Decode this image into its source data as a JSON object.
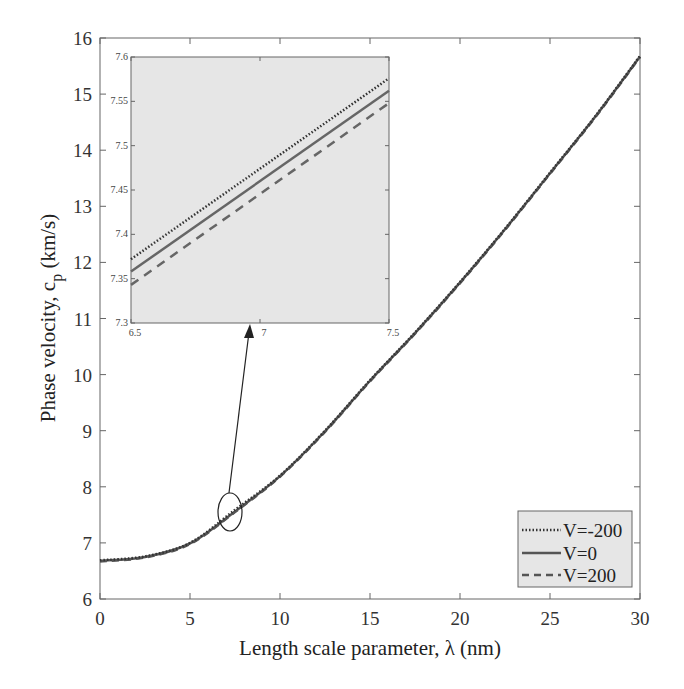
{
  "chart_data": [
    {
      "type": "line",
      "title": "",
      "xlabel": "Length scale parameter, λ (nm)",
      "ylabel": "Phase velocity, c_p (km/s)",
      "ylabel_main": "Phase velocity, c",
      "ylabel_sub": "p",
      "ylabel_unit": " (km/s)",
      "xlim": [
        0,
        30
      ],
      "ylim": [
        6,
        16
      ],
      "xticks": [
        0,
        5,
        10,
        15,
        20,
        25,
        30
      ],
      "yticks": [
        6,
        7,
        8,
        9,
        10,
        11,
        12,
        13,
        14,
        15,
        16
      ],
      "grid": false,
      "legend_position": "lower right",
      "x": [
        0,
        2.5,
        5,
        7.5,
        10,
        12.5,
        15,
        17.5,
        20,
        22.5,
        25,
        27.5,
        30
      ],
      "series": [
        {
          "name": "V=-200",
          "style": "dotted",
          "values": [
            6.69,
            6.76,
            7.0,
            7.59,
            8.2,
            9.0,
            9.9,
            10.75,
            11.65,
            12.6,
            13.6,
            14.6,
            15.68
          ]
        },
        {
          "name": "V=0",
          "style": "solid",
          "values": [
            6.68,
            6.75,
            6.99,
            7.56,
            8.19,
            8.99,
            9.89,
            10.74,
            11.64,
            12.59,
            13.59,
            14.59,
            15.67
          ]
        },
        {
          "name": "V=200",
          "style": "dashed",
          "values": [
            6.67,
            6.74,
            6.98,
            7.55,
            8.18,
            8.98,
            9.88,
            10.73,
            11.63,
            12.58,
            13.58,
            14.58,
            15.66
          ]
        }
      ],
      "annotations": [
        "Ellipse near λ≈7.3, c_p≈7.5 with arrow pointing to zoomed inset"
      ]
    },
    {
      "type": "line",
      "title": "Inset (zoom)",
      "xlim": [
        6.5,
        7.5
      ],
      "ylim": [
        7.3,
        7.6
      ],
      "xticks": [
        "6.5",
        "7",
        "7.5"
      ],
      "yticks": [
        "7.3",
        "7.35",
        "7.4",
        "7.45",
        "7.5",
        "7.55",
        "7.6"
      ],
      "x": [
        6.5,
        7.5
      ],
      "series": [
        {
          "name": "V=-200",
          "style": "dotted",
          "values": [
            7.372,
            7.576
          ]
        },
        {
          "name": "V=0",
          "style": "solid",
          "values": [
            7.358,
            7.562
          ]
        },
        {
          "name": "V=200",
          "style": "dashed",
          "values": [
            7.343,
            7.548
          ]
        }
      ],
      "background": "#e6e6e6"
    }
  ],
  "legend": {
    "items": [
      {
        "label": "V=-200",
        "style": "dotted"
      },
      {
        "label": "V=0",
        "style": "solid"
      },
      {
        "label": "V=200",
        "style": "dashed"
      }
    ]
  },
  "colors": {
    "line": "#555555",
    "dotted": "#333333",
    "inset_bg": "#e6e6e6",
    "axis": "#555555"
  }
}
